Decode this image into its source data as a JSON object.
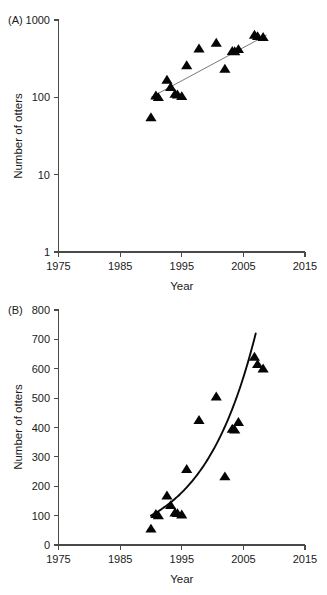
{
  "figure": {
    "panels": [
      {
        "id": "A",
        "label": "(A)",
        "scale": "log",
        "xlabel": "Year",
        "ylabel": "Number of otters",
        "xticks": [
          "1975",
          "1985",
          "1995",
          "2005",
          "2015"
        ],
        "yticks": [
          "1",
          "10",
          "100",
          "1000"
        ]
      },
      {
        "id": "B",
        "label": "(B)",
        "scale": "linear",
        "xlabel": "Year",
        "ylabel": "Number of otters",
        "xticks": [
          "1975",
          "1985",
          "1995",
          "2005",
          "2015"
        ],
        "yticks": [
          "0",
          "100",
          "200",
          "300",
          "400",
          "500",
          "600",
          "700",
          "800"
        ]
      }
    ]
  },
  "chart_data": [
    {
      "type": "scatter",
      "panel": "A",
      "title": "(A)",
      "xlabel": "Year",
      "ylabel": "Number of otters",
      "yscale": "log",
      "xlim": [
        1975,
        2015
      ],
      "ylim": [
        1,
        1000
      ],
      "xticks": [
        1975,
        1985,
        1995,
        2005,
        2015
      ],
      "yticks": [
        1,
        10,
        100,
        1000
      ],
      "grid": false,
      "legend": null,
      "series": [
        {
          "name": "Otter counts",
          "marker": "triangle",
          "color": "#050505",
          "points": [
            {
              "x": 1990.0,
              "y": 55
            },
            {
              "x": 1990.8,
              "y": 105
            },
            {
              "x": 1991.2,
              "y": 100
            },
            {
              "x": 1992.6,
              "y": 168
            },
            {
              "x": 1993.2,
              "y": 135
            },
            {
              "x": 1993.9,
              "y": 110
            },
            {
              "x": 1994.3,
              "y": 108
            },
            {
              "x": 1995.0,
              "y": 103
            },
            {
              "x": 1995.8,
              "y": 258
            },
            {
              "x": 1997.8,
              "y": 425
            },
            {
              "x": 2000.6,
              "y": 505
            },
            {
              "x": 2002.0,
              "y": 233
            },
            {
              "x": 2003.2,
              "y": 395
            },
            {
              "x": 2003.6,
              "y": 392
            },
            {
              "x": 2004.2,
              "y": 418
            },
            {
              "x": 2006.8,
              "y": 640
            },
            {
              "x": 2007.3,
              "y": 615
            },
            {
              "x": 2008.2,
              "y": 600
            }
          ]
        }
      ],
      "fit": {
        "type": "log-linear regression line",
        "color": "#6a6a6a",
        "x_start": 1990.0,
        "y_start": 100,
        "x_end": 2008.8,
        "y_end": 640
      }
    },
    {
      "type": "scatter",
      "panel": "B",
      "title": "(B)",
      "xlabel": "Year",
      "ylabel": "Number of otters",
      "yscale": "linear",
      "xlim": [
        1975,
        2015
      ],
      "ylim": [
        0,
        800
      ],
      "xticks": [
        1975,
        1985,
        1995,
        2005,
        2015
      ],
      "yticks": [
        0,
        100,
        200,
        300,
        400,
        500,
        600,
        700,
        800
      ],
      "grid": false,
      "legend": null,
      "series": [
        {
          "name": "Otter counts",
          "marker": "triangle",
          "color": "#050505",
          "points": [
            {
              "x": 1990.0,
              "y": 55
            },
            {
              "x": 1990.8,
              "y": 105
            },
            {
              "x": 1991.2,
              "y": 100
            },
            {
              "x": 1992.6,
              "y": 168
            },
            {
              "x": 1993.2,
              "y": 135
            },
            {
              "x": 1993.9,
              "y": 110
            },
            {
              "x": 1994.3,
              "y": 108
            },
            {
              "x": 1995.0,
              "y": 103
            },
            {
              "x": 1995.8,
              "y": 258
            },
            {
              "x": 1997.8,
              "y": 425
            },
            {
              "x": 2000.6,
              "y": 505
            },
            {
              "x": 2002.0,
              "y": 233
            },
            {
              "x": 2003.2,
              "y": 395
            },
            {
              "x": 2003.6,
              "y": 392
            },
            {
              "x": 2004.2,
              "y": 418
            },
            {
              "x": 2006.8,
              "y": 640
            },
            {
              "x": 2007.3,
              "y": 615
            },
            {
              "x": 2008.2,
              "y": 600
            }
          ]
        }
      ],
      "fit": {
        "type": "exponential curve",
        "color": "#0a0a0a",
        "x_start": 1990.0,
        "y_start": 100,
        "x_end": 2007.0,
        "y_end": 720
      }
    }
  ]
}
